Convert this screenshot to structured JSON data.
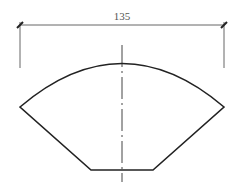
{
  "diagram": {
    "dimension_label": "135",
    "colors": {
      "outline": "#222222",
      "dimension": "#666666",
      "background": "#ffffff"
    }
  }
}
